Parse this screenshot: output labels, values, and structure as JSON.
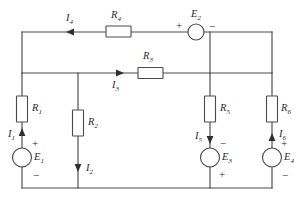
{
  "diagram": {
    "type": "electrical-circuit-schematic",
    "colors": {
      "wire": "#4a4a4a",
      "background": "#ffffff",
      "text": "#2b2b2b",
      "arrow": "#2f2f2f"
    },
    "resistors": [
      {
        "id": "R1",
        "label": "R",
        "subscript": "1",
        "branch": "left-rail",
        "orientation": "vertical"
      },
      {
        "id": "R2",
        "label": "R",
        "subscript": "2",
        "branch": "second-vertical",
        "orientation": "vertical"
      },
      {
        "id": "R3",
        "label": "R",
        "subscript": "3",
        "branch": "middle-horizontal",
        "orientation": "horizontal"
      },
      {
        "id": "R4",
        "label": "R",
        "subscript": "4",
        "branch": "top-horizontal",
        "orientation": "horizontal"
      },
      {
        "id": "R5",
        "label": "R",
        "subscript": "5",
        "branch": "third-vertical",
        "orientation": "vertical"
      },
      {
        "id": "R6",
        "label": "R",
        "subscript": "6",
        "branch": "right-rail",
        "orientation": "vertical"
      }
    ],
    "sources": [
      {
        "id": "E1",
        "label": "E",
        "subscript": "1",
        "branch": "left-rail",
        "plus": "top",
        "minus": "bottom",
        "label_side": "right"
      },
      {
        "id": "E2",
        "label": "E",
        "subscript": "2",
        "branch": "top-horizontal",
        "plus": "left",
        "minus": "right",
        "label_side": "above"
      },
      {
        "id": "E3",
        "label": "E",
        "subscript": "3",
        "branch": "third-vertical",
        "plus": "bottom",
        "minus": "top",
        "label_side": "right"
      },
      {
        "id": "E4",
        "label": "E",
        "subscript": "4",
        "branch": "right-rail",
        "plus": "top",
        "minus": "bottom",
        "label_side": "right"
      }
    ],
    "currents": [
      {
        "id": "I1",
        "label": "I",
        "subscript": "1",
        "branch": "left-rail",
        "direction": "up"
      },
      {
        "id": "I2",
        "label": "I",
        "subscript": "2",
        "branch": "second-vertical",
        "direction": "down"
      },
      {
        "id": "I3",
        "label": "I",
        "subscript": "3",
        "branch": "middle-horizontal",
        "direction": "right"
      },
      {
        "id": "I4",
        "label": "I",
        "subscript": "4",
        "branch": "top-horizontal",
        "direction": "left"
      },
      {
        "id": "I5",
        "label": "I",
        "subscript": "5",
        "branch": "third-vertical",
        "direction": "down"
      },
      {
        "id": "I6",
        "label": "I",
        "subscript": "6",
        "branch": "right-rail",
        "direction": "up"
      }
    ],
    "signs": {
      "plus": "+",
      "minus": "−"
    }
  }
}
